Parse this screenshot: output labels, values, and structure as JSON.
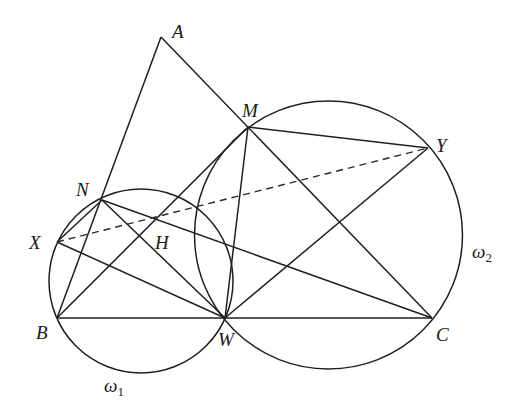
{
  "figure": {
    "type": "geometry-diagram",
    "points": {
      "A": {
        "x": 161,
        "y": 37
      },
      "M": {
        "x": 248,
        "y": 127
      },
      "N": {
        "x": 102,
        "y": 200
      },
      "X": {
        "x": 57,
        "y": 242
      },
      "B": {
        "x": 57,
        "y": 318
      },
      "W": {
        "x": 225,
        "y": 318
      },
      "C": {
        "x": 432,
        "y": 318
      },
      "Y": {
        "x": 428,
        "y": 148
      }
    },
    "circles": [
      {
        "name": "omega1",
        "label": "ω",
        "subscript": "1",
        "cx": 141,
        "cy": 281,
        "r": 92
      },
      {
        "name": "omega2",
        "label": "ω",
        "subscript": "2",
        "cx": 328.5,
        "cy": 235,
        "r": 134
      }
    ],
    "labels": {
      "A": "A",
      "M": "M",
      "N": "N",
      "X": "X",
      "H": "H",
      "B": "B",
      "W": "W",
      "C": "C",
      "Y": "Y"
    },
    "segments": [
      [
        "A",
        "B"
      ],
      [
        "A",
        "C"
      ],
      [
        "B",
        "C"
      ],
      [
        "M",
        "Y"
      ],
      [
        "Y",
        "W"
      ],
      [
        "M",
        "W"
      ],
      [
        "M",
        "B"
      ],
      [
        "N",
        "W"
      ],
      [
        "N",
        "C"
      ],
      [
        "N",
        "X"
      ],
      [
        "N",
        "B"
      ],
      [
        "X",
        "W"
      ]
    ],
    "dashed_segments": [
      [
        "X",
        "Y"
      ]
    ]
  }
}
